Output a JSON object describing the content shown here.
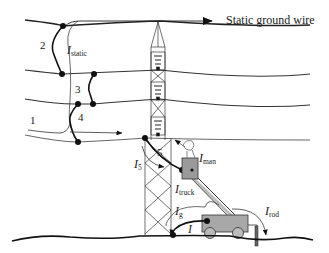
{
  "diagram": {
    "title_label": "Static ground wire",
    "numbers": {
      "n1": "1",
      "n2": "2",
      "n3": "3",
      "n4": "4",
      "n5": "5"
    },
    "currents": {
      "static": {
        "symbol": "I",
        "sub": "static"
      },
      "i5": {
        "symbol": "I",
        "sub": "5"
      },
      "man": {
        "symbol": "I",
        "sub": "man"
      },
      "truck": {
        "symbol": "I",
        "sub": "truck"
      },
      "g": {
        "symbol": "I",
        "sub": "g"
      },
      "i": {
        "symbol": "I",
        "sub": ""
      },
      "rod": {
        "symbol": "I",
        "sub": "rod"
      }
    },
    "elements": [
      "static ground wire",
      "three phase conductors",
      "lattice transmission tower with insulator strings",
      "jumpers 2, 3, 4, 5",
      "bucket truck with worker in bucket",
      "ground rod",
      "earth surface"
    ],
    "colors": {
      "line": "#222222",
      "thin_line": "#555555",
      "bucket_fill": "#9a9a9a",
      "truck_fill": "#a8a8a8"
    }
  }
}
